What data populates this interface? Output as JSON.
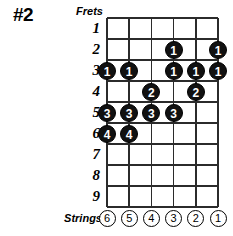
{
  "title": "#2",
  "labels": {
    "frets": "Frets",
    "strings": "Strings"
  },
  "colors": {
    "dot_fill": "#111111",
    "dot_text": "#ffffff",
    "grid_line": "#2b2b2b",
    "background": "#ffffff"
  },
  "chart_data": {
    "type": "table",
    "title": "#2",
    "xlabel": "Strings",
    "ylabel": "Frets",
    "grid": true,
    "frets": [
      1,
      2,
      3,
      4,
      5,
      6,
      7,
      8,
      9
    ],
    "fret_labels": [
      "1",
      "2",
      "3",
      "4",
      "5",
      "6",
      "7",
      "8",
      "9"
    ],
    "strings": [
      6,
      5,
      4,
      3,
      2,
      1
    ],
    "string_labels": [
      "6",
      "5",
      "4",
      "3",
      "2",
      "1"
    ],
    "dots": [
      {
        "string": 3,
        "fret": 2,
        "finger": "1"
      },
      {
        "string": 1,
        "fret": 2,
        "finger": "1"
      },
      {
        "string": 6,
        "fret": 3,
        "finger": "1"
      },
      {
        "string": 5,
        "fret": 3,
        "finger": "1"
      },
      {
        "string": 3,
        "fret": 3,
        "finger": "1"
      },
      {
        "string": 2,
        "fret": 3,
        "finger": "1"
      },
      {
        "string": 1,
        "fret": 3,
        "finger": "1"
      },
      {
        "string": 4,
        "fret": 4,
        "finger": "2"
      },
      {
        "string": 2,
        "fret": 4,
        "finger": "2"
      },
      {
        "string": 6,
        "fret": 5,
        "finger": "3"
      },
      {
        "string": 5,
        "fret": 5,
        "finger": "3"
      },
      {
        "string": 4,
        "fret": 5,
        "finger": "3"
      },
      {
        "string": 3,
        "fret": 5,
        "finger": "3"
      },
      {
        "string": 6,
        "fret": 6,
        "finger": "4"
      },
      {
        "string": 5,
        "fret": 6,
        "finger": "4"
      }
    ]
  }
}
